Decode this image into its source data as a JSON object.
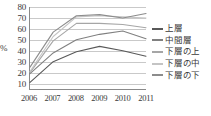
{
  "chart_data": {
    "type": "line",
    "title": "",
    "xlabel": "",
    "ylabel": "%",
    "categories": [
      "2006",
      "2007",
      "2008",
      "2009",
      "2010",
      "2011"
    ],
    "ylim": [
      5,
      80
    ],
    "yticks": [
      10,
      20,
      30,
      40,
      50,
      60,
      70,
      80
    ],
    "ytick_labels": [
      "10",
      "20",
      "30",
      "40",
      "50",
      "60",
      "70",
      "80"
    ],
    "grid": true,
    "legend_position": "right",
    "series": [
      {
        "name": "上層",
        "color": "#595959",
        "values": [
          11,
          30,
          39,
          44,
          40,
          35
        ]
      },
      {
        "name": "中間層",
        "color": "#808080",
        "values": [
          19,
          38,
          50,
          55,
          58,
          51
        ]
      },
      {
        "name": "下層の上",
        "color": "#a6a6a6",
        "values": [
          20,
          49,
          65,
          65,
          64,
          61
        ]
      },
      {
        "name": "下層の中",
        "color": "#c4c4c4",
        "values": [
          21,
          53,
          71,
          72,
          71,
          70
        ]
      },
      {
        "name": "下層の下",
        "color": "#8c8c8c",
        "values": [
          25,
          57,
          72,
          73,
          70,
          74
        ]
      }
    ]
  }
}
